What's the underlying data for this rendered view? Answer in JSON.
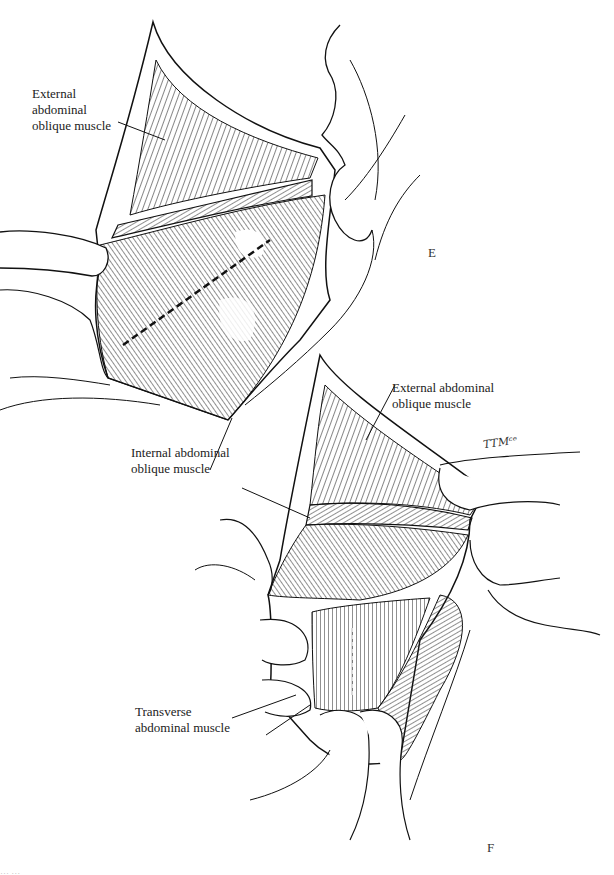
{
  "figure": {
    "panels": [
      {
        "letter": "E",
        "labels": [
          {
            "id": "ext-oblique-e",
            "lines": [
              "External",
              "abdominal",
              "oblique muscle"
            ]
          },
          {
            "id": "int-oblique",
            "lines": [
              "Internal abdominal",
              "oblique muscle"
            ]
          }
        ]
      },
      {
        "letter": "F",
        "labels": [
          {
            "id": "ext-oblique-f",
            "lines": [
              "External abdominal",
              "oblique muscle"
            ]
          },
          {
            "id": "transverse",
            "lines": [
              "Transverse",
              "abdominal muscle"
            ]
          }
        ]
      }
    ],
    "signature": "TTMᶜᵉ",
    "caption_partial": "… …"
  },
  "colors": {
    "ink": "#1a1a1a",
    "background": "#ffffff"
  }
}
